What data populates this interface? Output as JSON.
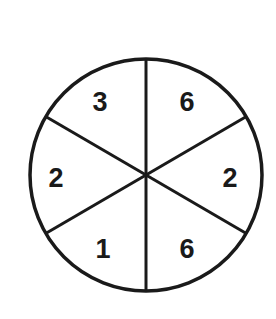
{
  "spinner": {
    "sections": [
      {
        "position": "top-left",
        "label": "3"
      },
      {
        "position": "top-right",
        "label": "6"
      },
      {
        "position": "right",
        "label": "2"
      },
      {
        "position": "bottom-right",
        "label": "6"
      },
      {
        "position": "bottom-left",
        "label": "1"
      },
      {
        "position": "left",
        "label": "2"
      }
    ],
    "section_count": 6,
    "stroke_color": "#1a1a1a",
    "fill_color": "#ffffff"
  }
}
